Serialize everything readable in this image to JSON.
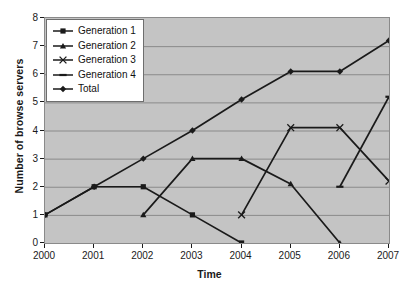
{
  "chart_data": {
    "type": "line",
    "title": "",
    "xlabel": "Time",
    "ylabel": "Number of browse servers",
    "x": [
      2000,
      2001,
      2002,
      2003,
      2004,
      2005,
      2006,
      2007
    ],
    "xticklabels": [
      "2000",
      "2001",
      "2002",
      "2003",
      "2004",
      "2005",
      "2006",
      "2007"
    ],
    "yticklabels": [
      "0",
      "1",
      "2",
      "3",
      "4",
      "5",
      "6",
      "7",
      "8"
    ],
    "ylim": [
      0,
      8
    ],
    "xlim": [
      2000,
      2007
    ],
    "grid": "horizontal",
    "legend_position": "upper-left-inside",
    "plot_background": "#c4c4c4",
    "figure_background": "#ffffff",
    "line_color": "#1a1a1a",
    "grid_color": "#8a8a8a",
    "series": [
      {
        "name": "Generation 1",
        "marker": "square",
        "points": [
          {
            "x": 2000,
            "y": 1
          },
          {
            "x": 2001,
            "y": 2
          },
          {
            "x": 2002,
            "y": 2
          },
          {
            "x": 2003,
            "y": 1
          },
          {
            "x": 2004,
            "y": 0
          }
        ]
      },
      {
        "name": "Generation 2",
        "marker": "triangle",
        "points": [
          {
            "x": 2002,
            "y": 1
          },
          {
            "x": 2003,
            "y": 3
          },
          {
            "x": 2004,
            "y": 3
          },
          {
            "x": 2005,
            "y": 2.1
          },
          {
            "x": 2006,
            "y": 0
          }
        ]
      },
      {
        "name": "Generation 3",
        "marker": "x",
        "points": [
          {
            "x": 2004,
            "y": 1
          },
          {
            "x": 2005,
            "y": 4.1
          },
          {
            "x": 2006,
            "y": 4.1
          },
          {
            "x": 2007,
            "y": 2.2
          }
        ]
      },
      {
        "name": "Generation 4",
        "marker": "dash",
        "points": [
          {
            "x": 2006,
            "y": 2
          },
          {
            "x": 2007,
            "y": 5.2
          }
        ]
      },
      {
        "name": "Total",
        "marker": "diamond",
        "points": [
          {
            "x": 2000,
            "y": 1
          },
          {
            "x": 2001,
            "y": 2
          },
          {
            "x": 2002,
            "y": 3
          },
          {
            "x": 2003,
            "y": 4
          },
          {
            "x": 2004,
            "y": 5.1
          },
          {
            "x": 2005,
            "y": 6.1
          },
          {
            "x": 2006,
            "y": 6.1
          },
          {
            "x": 2007,
            "y": 7.2
          }
        ]
      }
    ]
  }
}
